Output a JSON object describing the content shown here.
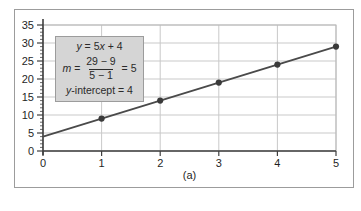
{
  "figure": {
    "caption": "(a)"
  },
  "annotation": {
    "line1": {
      "y": "y",
      "mid": " = 5",
      "x": "x",
      "tail": " + 4"
    },
    "line2": {
      "m": "m",
      "eq": " = ",
      "numerator": "29 − 9",
      "denominator": "5 − 1",
      "result": " = 5"
    },
    "line3": {
      "y": "y",
      "rest": "-intercept = 4"
    }
  },
  "chart_data": {
    "type": "line",
    "title": "",
    "equation": "y = 5x + 4",
    "slope": 5,
    "y_intercept": 4,
    "x": [
      0,
      1,
      2,
      3,
      4,
      5
    ],
    "y": [
      4,
      9,
      14,
      19,
      24,
      29
    ],
    "marker_x": [
      1,
      2,
      3,
      4,
      5
    ],
    "marker_y": [
      9,
      14,
      19,
      24,
      29
    ],
    "series": [
      {
        "name": "y = 5x + 4",
        "x": [
          0,
          1,
          2,
          3,
          4,
          5
        ],
        "y": [
          4,
          9,
          14,
          19,
          24,
          29
        ]
      }
    ],
    "xlim": [
      0,
      5
    ],
    "ylim": [
      0,
      35
    ],
    "x_ticks": [
      0,
      1,
      2,
      3,
      4,
      5
    ],
    "y_ticks": [
      0,
      5,
      10,
      15,
      20,
      25,
      30,
      35
    ],
    "y_minor_step": 1,
    "grid": true,
    "legend": "none",
    "caption": "(a)",
    "colors": {
      "line": "#4a4a4a",
      "marker": "#3a3a3a",
      "grid": "#c9c9c9",
      "plot_border": "#b8b8b8",
      "axis": "#3f3f3f",
      "label": "#1f1f1f",
      "frame_border": "#9c9c9c",
      "annotation_bg": "#d5d5d5",
      "annotation_border": "#9c9c9c"
    }
  }
}
